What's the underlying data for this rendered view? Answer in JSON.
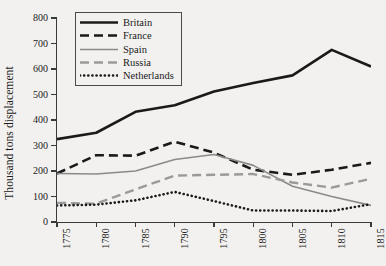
{
  "chart_data": {
    "type": "line",
    "title": "",
    "xlabel": "",
    "ylabel": "Thousand tons displacement",
    "categories": [
      "1775",
      "1780",
      "1785",
      "1790",
      "1795",
      "1800",
      "1805",
      "1810",
      "1815"
    ],
    "x": [
      1775,
      1780,
      1785,
      1790,
      1795,
      1800,
      1805,
      1810,
      1815
    ],
    "xlim": [
      1775,
      1815
    ],
    "ylim": [
      0,
      800
    ],
    "yticks": [
      0,
      100,
      200,
      300,
      400,
      500,
      600,
      700,
      800
    ],
    "ytick_labels": [
      "0",
      "100",
      "200",
      "300",
      "400",
      "500",
      "600",
      "700",
      "800"
    ],
    "grid": false,
    "legend_position": "top-left-inside",
    "series": [
      {
        "name": "Britain",
        "color": "#1a1a1a",
        "style": "solid",
        "width": 2.6,
        "values": [
          325,
          350,
          432,
          458,
          512,
          545,
          575,
          675,
          610
        ]
      },
      {
        "name": "France",
        "color": "#1a1a1a",
        "style": "dashed",
        "width": 2.6,
        "values": [
          190,
          262,
          260,
          315,
          272,
          205,
          185,
          205,
          232
        ]
      },
      {
        "name": "Spain",
        "color": "#8a8a8a",
        "style": "solid",
        "width": 1.6,
        "values": [
          190,
          188,
          200,
          245,
          265,
          222,
          140,
          100,
          65
        ]
      },
      {
        "name": "Russia",
        "color": "#9a9a9a",
        "style": "dashed",
        "width": 2.4,
        "values": [
          75,
          72,
          128,
          182,
          185,
          188,
          155,
          135,
          170
        ]
      },
      {
        "name": "Netherlands",
        "color": "#1a1a1a",
        "style": "dotted",
        "width": 2.6,
        "values": [
          65,
          68,
          85,
          118,
          82,
          45,
          45,
          43,
          70
        ]
      }
    ]
  },
  "legend": {
    "entries": [
      "Britain",
      "France",
      "Spain",
      "Russia",
      "Netherlands"
    ]
  },
  "colors": {
    "background": "#f2f1ef",
    "axis": "#3a3a3a",
    "dark_series": "#1a1a1a",
    "gray_series": "#8a8a8a"
  }
}
